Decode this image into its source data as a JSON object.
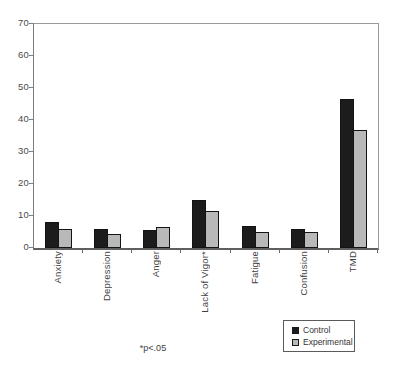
{
  "chart_data": {
    "type": "bar",
    "title": "",
    "categories": [
      "Anxiety",
      "Depression",
      "Anger",
      "Lack of Vigor*",
      "Fatigue",
      "Confusion",
      "TMD"
    ],
    "series": [
      {
        "name": "Control",
        "color": "#1c1c1c",
        "values": [
          8,
          6,
          5.5,
          15,
          7,
          6,
          46.5
        ]
      },
      {
        "name": "Experimental",
        "color": "#b9b9b9",
        "values": [
          6,
          4.5,
          6.5,
          11.5,
          5,
          5,
          37
        ]
      }
    ],
    "xlabel": "",
    "ylabel": "",
    "ylim": [
      0,
      70
    ],
    "yticks": [
      0,
      10,
      20,
      30,
      40,
      50,
      60,
      70
    ],
    "grid": false,
    "legend_position": "bottom-right",
    "footnote": "*p<.05"
  }
}
